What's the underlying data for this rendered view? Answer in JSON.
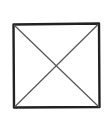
{
  "diagram": {
    "kind": "image-placeholder-sketch",
    "description": "Hand-drawn square with an X (two diagonals)",
    "shape": {
      "frame": {
        "x1": 13,
        "y1": 24,
        "x2": 99,
        "y2": 107
      },
      "stroke_color": "#222222",
      "diagonal_color": "#555555"
    }
  }
}
